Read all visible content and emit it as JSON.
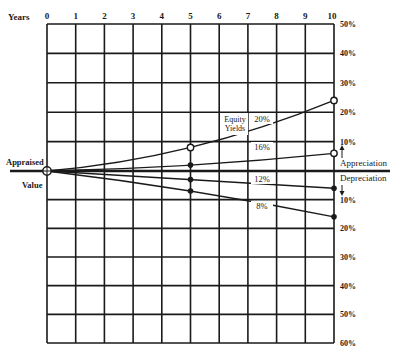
{
  "chart_data": {
    "type": "line",
    "title": "",
    "xlabel": "Years",
    "ylabel": "",
    "x_ticks": [
      "0",
      "1",
      "2",
      "3",
      "4",
      "5",
      "6",
      "7",
      "8",
      "9",
      "10"
    ],
    "xlim": [
      0,
      10
    ],
    "y_ticks_right_upper": [
      "50%",
      "40%",
      "30%",
      "20%",
      "10%"
    ],
    "y_ticks_right_lower": [
      "10%",
      "20%",
      "30%",
      "40%",
      "50%",
      "60%"
    ],
    "ylim": [
      -60,
      50
    ],
    "y_units": "% change in value (appreciation positive, depreciation negative)",
    "grid": true,
    "origin_label_top": "Appraised",
    "origin_label_bottom": "Value",
    "upper_axis_label": "Appreciation",
    "lower_axis_label": "Depreciation",
    "series_group_label_line1": "Equity",
    "series_group_label_line2": "Yields",
    "series": [
      {
        "name": "20%",
        "x": [
          0,
          5,
          10
        ],
        "y": [
          0,
          8,
          24
        ]
      },
      {
        "name": "16%",
        "x": [
          0,
          5,
          10
        ],
        "y": [
          0,
          2,
          6
        ]
      },
      {
        "name": "12%",
        "x": [
          0,
          5,
          10
        ],
        "y": [
          0,
          -3,
          -6
        ]
      },
      {
        "name": "8%",
        "x": [
          0,
          5,
          10
        ],
        "y": [
          0,
          -7,
          -16
        ]
      }
    ],
    "markers": [
      {
        "series": "20%",
        "x": 5,
        "style": "open-circle"
      },
      {
        "series": "20%",
        "x": 10,
        "style": "open-circle"
      },
      {
        "series": "16%",
        "x": 5,
        "style": "dot"
      },
      {
        "series": "16%",
        "x": 10,
        "style": "open-circle"
      },
      {
        "series": "12%",
        "x": 5,
        "style": "dot"
      },
      {
        "series": "12%",
        "x": 10,
        "style": "dot"
      },
      {
        "series": "8%",
        "x": 5,
        "style": "dot"
      },
      {
        "series": "8%",
        "x": 10,
        "style": "dot"
      }
    ],
    "legend_position": "inline labels near x=7-8"
  },
  "colors": {
    "ink": "#1a1a1a",
    "background": "#ffffff"
  }
}
